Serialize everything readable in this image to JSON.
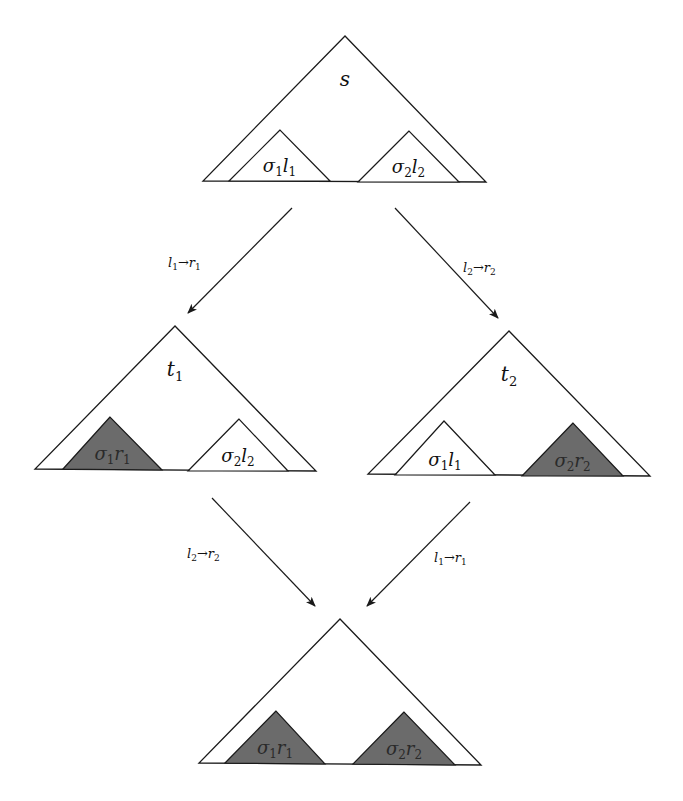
{
  "diagram": {
    "colors": {
      "stroke": "#1a1a1a",
      "dark_fill": "#6b6b6b",
      "background": "#ffffff"
    },
    "nodes": [
      {
        "id": "s",
        "label": "s",
        "apex": [
          345,
          36
        ],
        "base_left": [
          203,
          181
        ],
        "base_right": [
          486,
          182
        ],
        "subterms": [
          {
            "label_main": "σ",
            "label_sub1": "1",
            "label_var": "l",
            "label_sub2": "1",
            "shaded": false,
            "apex": [
              280,
              130
            ],
            "bl": [
              229,
              181
            ],
            "br": [
              330,
              181
            ]
          },
          {
            "label_main": "σ",
            "label_sub1": "2",
            "label_var": "l",
            "label_sub2": "2",
            "shaded": false,
            "apex": [
              409,
              131
            ],
            "bl": [
              358,
              182
            ],
            "br": [
              459,
              182
            ]
          }
        ]
      },
      {
        "id": "t1",
        "label": "t",
        "label_sub": "1",
        "apex": [
          175,
          326
        ],
        "base_left": [
          35,
          469
        ],
        "base_right": [
          316,
          471
        ],
        "subterms": [
          {
            "label_main": "σ",
            "label_sub1": "1",
            "label_var": "r",
            "label_sub2": "1",
            "shaded": true,
            "apex": [
              110,
              417
            ],
            "bl": [
              63,
              469
            ],
            "br": [
              162,
              470
            ]
          },
          {
            "label_main": "σ",
            "label_sub1": "2",
            "label_var": "l",
            "label_sub2": "2",
            "shaded": false,
            "apex": [
              239,
              419
            ],
            "bl": [
              188,
              471
            ],
            "br": [
              288,
              471
            ]
          }
        ]
      },
      {
        "id": "t2",
        "label": "t",
        "label_sub": "2",
        "apex": [
          509,
          331
        ],
        "base_left": [
          368,
          474
        ],
        "base_right": [
          650,
          476
        ],
        "subterms": [
          {
            "label_main": "σ",
            "label_sub1": "1",
            "label_var": "l",
            "label_sub2": "1",
            "shaded": false,
            "apex": [
              444,
              421
            ],
            "bl": [
              395,
              475
            ],
            "br": [
              495,
              475
            ]
          },
          {
            "label_main": "σ",
            "label_sub1": "2",
            "label_var": "r",
            "label_sub2": "2",
            "shaded": true,
            "apex": [
              573,
              423
            ],
            "bl": [
              522,
              476
            ],
            "br": [
              623,
              476
            ]
          }
        ]
      },
      {
        "id": "u",
        "label": "",
        "apex": [
          340,
          619
        ],
        "base_left": [
          199,
          763
        ],
        "base_right": [
          481,
          765
        ],
        "subterms": [
          {
            "label_main": "σ",
            "label_sub1": "1",
            "label_var": "r",
            "label_sub2": "1",
            "shaded": true,
            "apex": [
              276,
              711
            ],
            "bl": [
              225,
              763
            ],
            "br": [
              325,
              764
            ]
          },
          {
            "label_main": "σ",
            "label_sub1": "2",
            "label_var": "r",
            "label_sub2": "2",
            "shaded": true,
            "apex": [
              404,
              712
            ],
            "bl": [
              353,
              764
            ],
            "br": [
              455,
              765
            ]
          }
        ]
      }
    ],
    "edges": [
      {
        "from": "s",
        "to": "t1",
        "rule_lhs": "l",
        "rule_lhs_sub": "1",
        "arrow": "→",
        "rule_rhs": "r",
        "rule_rhs_sub": "1",
        "start": [
          292,
          208
        ],
        "end": [
          188,
          313
        ],
        "label_pos": [
          168,
          267
        ]
      },
      {
        "from": "s",
        "to": "t2",
        "rule_lhs": "l",
        "rule_lhs_sub": "2",
        "arrow": "→",
        "rule_rhs": "r",
        "rule_rhs_sub": "2",
        "start": [
          395,
          208
        ],
        "end": [
          498,
          318
        ],
        "label_pos": [
          463,
          272
        ]
      },
      {
        "from": "t1",
        "to": "u",
        "rule_lhs": "l",
        "rule_lhs_sub": "2",
        "arrow": "→",
        "rule_rhs": "r",
        "rule_rhs_sub": "2",
        "start": [
          212,
          498
        ],
        "end": [
          315,
          606
        ],
        "label_pos": [
          187,
          558
        ]
      },
      {
        "from": "t2",
        "to": "u",
        "rule_lhs": "l",
        "rule_lhs_sub": "1",
        "arrow": "→",
        "rule_rhs": "r",
        "rule_rhs_sub": "1",
        "start": [
          470,
          502
        ],
        "end": [
          367,
          606
        ],
        "label_pos": [
          434,
          562
        ]
      }
    ]
  }
}
